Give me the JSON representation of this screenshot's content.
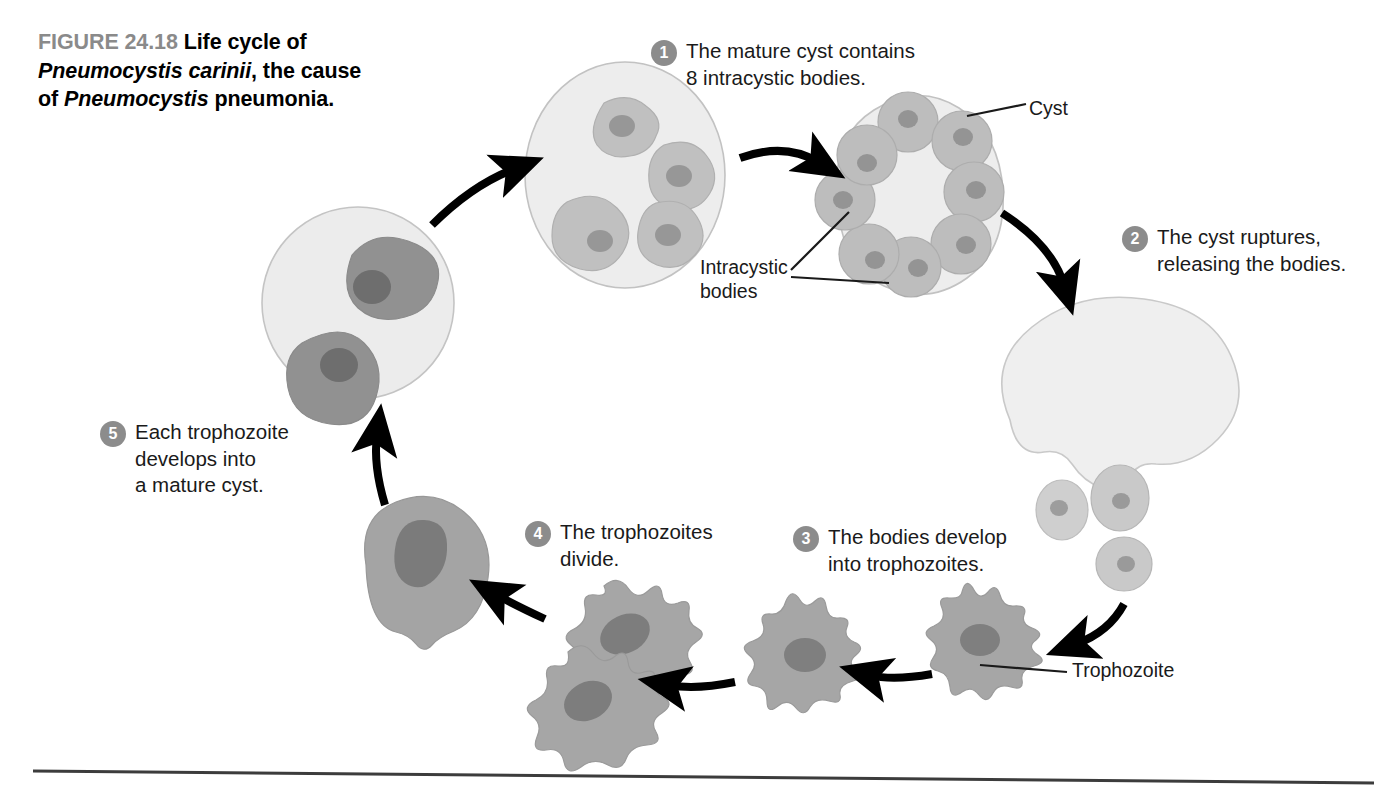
{
  "figure": {
    "number": "FIGURE 24.18",
    "title_part1": "Life cycle of",
    "title_species": "Pneumocystis carinii",
    "title_part2": ", the cause",
    "title_part3": "of ",
    "title_species2": "Pneumocystis",
    "title_part4": " pneumonia.",
    "full_caption": "FIGURE 24.18 Life cycle of Pneumocystis carinii, the cause of Pneumocystis pneumonia."
  },
  "steps": [
    {
      "number": "1",
      "text": "The mature cyst contains\n8 intracystic bodies."
    },
    {
      "number": "2",
      "text": "The cyst ruptures,\nreleasing the bodies."
    },
    {
      "number": "3",
      "text": "The bodies develop\ninto trophozoites."
    },
    {
      "number": "4",
      "text": "The trophozoites\ndivide."
    },
    {
      "number": "5",
      "text": "Each trophozoite\ndevelops into\na mature cyst."
    }
  ],
  "structure_labels": {
    "cyst": "Cyst",
    "intracystic_bodies": "Intracystic\nbodies",
    "trophozoite": "Trophozoite"
  },
  "colors": {
    "cyst_fill": "#ededed",
    "cyst_stroke": "#b9b9b9",
    "body_fill": "#c3c3c3",
    "body_stroke": "#aeaeae",
    "nucleus_fill": "#969696",
    "trophozoite_fill": "#a3a3a3",
    "trophozoite_nucleus": "#7d7d7d",
    "dark_body_fill": "#949494",
    "dark_body_nucleus": "#6f6f6f",
    "arrow": "#000000",
    "badge": "#8c8c8c",
    "fig_num": "#8a8a8a",
    "rule": "#3c3c3c",
    "background": "#ffffff"
  },
  "cycle_stages": [
    {
      "name": "developing-cyst-4-bodies",
      "bodies": 4,
      "description": "Cyst containing four irregular intracystic bodies"
    },
    {
      "name": "mature-cyst-8-bodies",
      "bodies": 8,
      "description": "Mature cyst containing eight round intracystic bodies arranged in a ring"
    },
    {
      "name": "ruptured-cyst",
      "bodies": 3,
      "description": "Ruptured cyst releasing three intracystic bodies"
    },
    {
      "name": "trophozoite",
      "bodies": 1,
      "description": "Single amoeboid trophozoite with pseudopods"
    },
    {
      "name": "dividing-trophozoites",
      "bodies": 2,
      "description": "Two trophozoites joined during division"
    },
    {
      "name": "rounded-trophozoite",
      "bodies": 1,
      "description": "Rounded trophozoite with large nucleus"
    },
    {
      "name": "early-cyst-2-bodies",
      "bodies": 2,
      "description": "Early cyst containing two dark amoeboid bodies"
    }
  ]
}
